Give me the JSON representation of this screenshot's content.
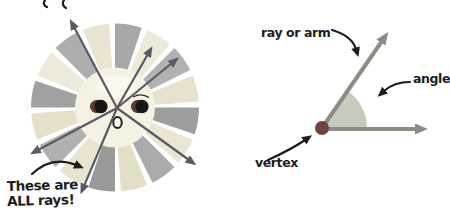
{
  "left_diagram": {
    "caption_line1": "These are",
    "caption_line2": "ALL rays!",
    "ray_arrow_color": "#5b5a63",
    "sun_face_color": "#f5f2e4",
    "sun_highlight_color": "#fbf9ef",
    "eye_color": "#161616",
    "eye_crescent_color": "#5d3a33",
    "mouth_fill": "#fbf9f1",
    "wedge_colors": [
      "#a7a7a7",
      "#edeada",
      "#b2b2b2",
      "#e6e2cd",
      "#9d9d9d",
      "#eae6d3",
      "#ababab",
      "#e3dfc7",
      "#9a9a9a",
      "#e8e4cf",
      "#b0b0b0",
      "#e5e1c9",
      "#a1a1a1",
      "#eeebdc",
      "#adadad",
      "#e9e5d2"
    ]
  },
  "right_diagram": {
    "ray_label": "ray or arm",
    "angle_label": "angle",
    "vertex_label": "vertex",
    "ray_color": "#8d8c84",
    "angle_fill": "#c6ccbd",
    "vertex_color": "#6f463e",
    "annotation_color": "#1d1d1d"
  }
}
